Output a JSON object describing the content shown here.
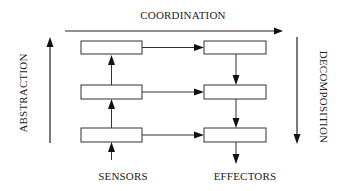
{
  "diagram": {
    "type": "layered control architecture",
    "labels": {
      "top": "COORDINATION",
      "left": "ABSTRACTION",
      "right": "DECOMPOSITION",
      "bottom_left": "SENSORS",
      "bottom_right": "EFFECTORS"
    },
    "axes": [
      {
        "name": "coordination",
        "direction": "left-to-right"
      },
      {
        "name": "abstraction",
        "direction": "bottom-to-top"
      },
      {
        "name": "decomposition",
        "direction": "top-to-bottom"
      }
    ],
    "nodes": [
      {
        "id": "left-top",
        "column": "left",
        "row": 1,
        "label": ""
      },
      {
        "id": "left-middle",
        "column": "left",
        "row": 2,
        "label": ""
      },
      {
        "id": "left-bottom",
        "column": "left",
        "row": 3,
        "label": ""
      },
      {
        "id": "right-top",
        "column": "right",
        "row": 1,
        "label": ""
      },
      {
        "id": "right-middle",
        "column": "right",
        "row": 2,
        "label": ""
      },
      {
        "id": "right-bottom",
        "column": "right",
        "row": 3,
        "label": ""
      }
    ],
    "edges": [
      {
        "from": "sensors",
        "to": "left-bottom"
      },
      {
        "from": "left-bottom",
        "to": "left-middle"
      },
      {
        "from": "left-middle",
        "to": "left-top"
      },
      {
        "from": "left-top",
        "to": "right-top"
      },
      {
        "from": "left-middle",
        "to": "right-middle"
      },
      {
        "from": "left-bottom",
        "to": "right-bottom"
      },
      {
        "from": "right-top",
        "to": "right-middle"
      },
      {
        "from": "right-middle",
        "to": "right-bottom"
      },
      {
        "from": "right-bottom",
        "to": "effectors"
      }
    ],
    "colors": {
      "stroke": "#333333",
      "text": "#222222",
      "background": "#ffffff"
    }
  }
}
